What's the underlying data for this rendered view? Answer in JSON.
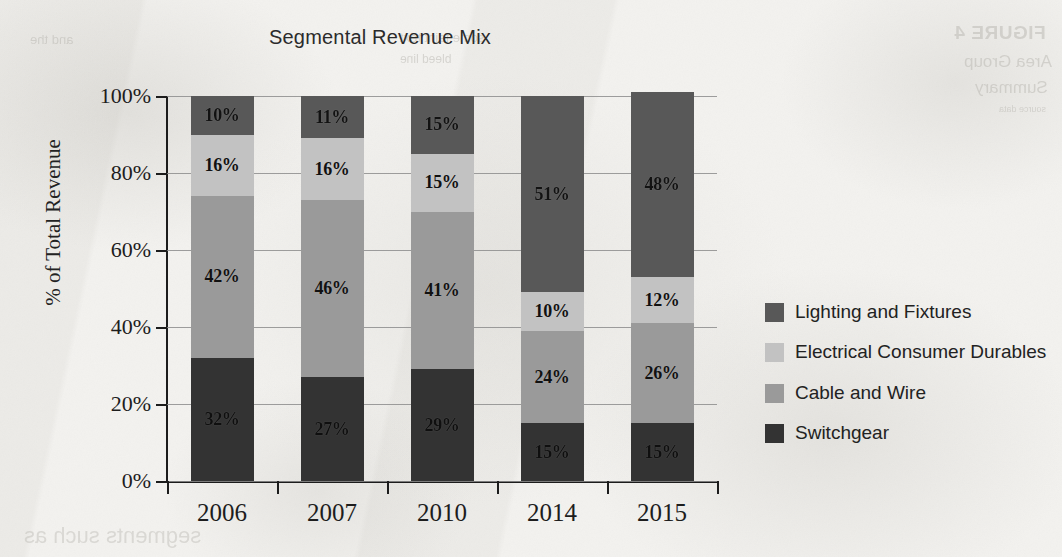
{
  "chart_data": {
    "type": "bar",
    "subtype": "stacked-bar-100-percent",
    "title": "Segmental Revenue Mix",
    "xlabel": "",
    "ylabel": "% of Total Revenue",
    "categories": [
      "2006",
      "2007",
      "2010",
      "2014",
      "2015"
    ],
    "ylim": [
      0,
      100
    ],
    "ytick_labels": [
      "0%",
      "20%",
      "40%",
      "60%",
      "80%",
      "100%"
    ],
    "ytick_values": [
      0,
      20,
      40,
      60,
      80,
      100
    ],
    "grid": true,
    "legend_position": "right",
    "value_suffix": "%",
    "series": [
      {
        "name": "Switchgear",
        "color": "#333333",
        "stack_order": 0,
        "values": [
          32,
          27,
          29,
          15,
          15
        ],
        "labels": [
          "32%",
          "27%",
          "29%",
          "15%",
          "15%"
        ]
      },
      {
        "name": "Cable and Wire",
        "color": "#9a9a9a",
        "stack_order": 1,
        "values": [
          42,
          46,
          41,
          24,
          26
        ],
        "labels": [
          "42%",
          "46%",
          "41%",
          "24%",
          "26%"
        ]
      },
      {
        "name": "Electrical Consumer Durables",
        "color": "#c2c2c2",
        "stack_order": 2,
        "values": [
          16,
          16,
          15,
          10,
          12
        ],
        "labels": [
          "16%",
          "16%",
          "15%",
          "10%",
          "12%"
        ]
      },
      {
        "name": "Lighting and Fixtures",
        "color": "#585858",
        "stack_order": 3,
        "values": [
          10,
          11,
          15,
          51,
          48
        ],
        "labels": [
          "10%",
          "11%",
          "15%",
          "51%",
          "48%"
        ]
      }
    ]
  },
  "legend": {
    "items": [
      {
        "label": "Lighting and Fixtures",
        "color": "#585858"
      },
      {
        "label": "Electrical Consumer Durables",
        "color": "#c2c2c2"
      },
      {
        "label": "Cable and Wire",
        "color": "#9a9a9a"
      },
      {
        "label": "Switchgear",
        "color": "#333333"
      }
    ]
  },
  "page": {
    "background_color": "#f3f2ef",
    "bleed_through": {
      "top_right_1": "FIGURE 4",
      "top_right_2": "Area Group",
      "top_right_3": "Summary",
      "top_right_4": "source data",
      "top_left_1": "and the",
      "top_mid_1": "some faint text",
      "top_mid_2": "bleed line",
      "bottom_1": "segments such as"
    }
  }
}
